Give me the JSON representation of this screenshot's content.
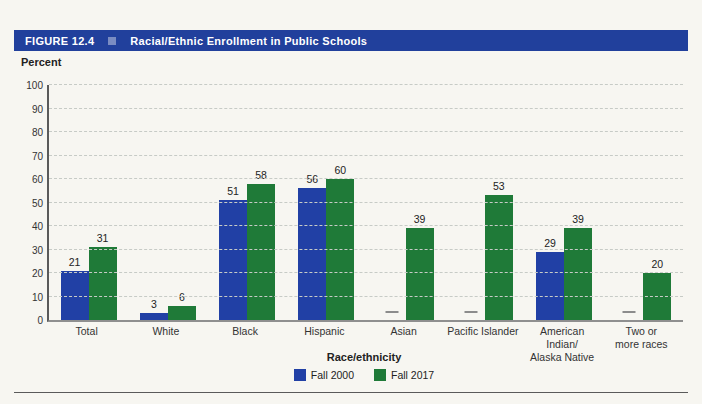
{
  "header": {
    "figure_label": "FIGURE 12.4",
    "title": "Racial/Ethnic Enrollment in Public Schools"
  },
  "colors": {
    "background": "#f7f6f1",
    "header_bg": "#21409c",
    "header_square": "#7a8cc2",
    "fall_2000": "#2140a5",
    "fall_2017": "#1f7a38",
    "gridline": "#c7cbc6",
    "missing_dash": "#8c8c8c",
    "axis": "#5a5a5a"
  },
  "chart_data": {
    "type": "bar",
    "title": "Racial/Ethnic Enrollment in Public Schools",
    "xlabel": "Race/ethnicity",
    "ylabel": "Percent",
    "ylim": [
      0,
      100
    ],
    "ytick_step": 10,
    "grid": true,
    "legend_position": "bottom",
    "missing_marker": "—",
    "categories": [
      "Total",
      "White",
      "Black",
      "Hispanic",
      "Asian",
      "Pacific Islander",
      "American\nIndian/\nAlaska Native",
      "Two or\nmore races"
    ],
    "series": [
      {
        "name": "Fall 2000",
        "color": "#2140a5",
        "values": [
          21,
          3,
          51,
          56,
          null,
          null,
          29,
          null
        ]
      },
      {
        "name": "Fall 2017",
        "color": "#1f7a38",
        "values": [
          31,
          6,
          58,
          60,
          39,
          53,
          39,
          20
        ]
      }
    ]
  }
}
